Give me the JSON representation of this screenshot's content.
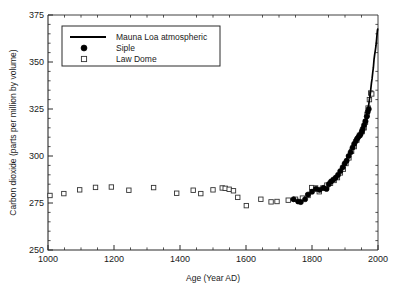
{
  "figure": {
    "width": 408,
    "height": 294,
    "background": "#ffffff"
  },
  "chart_data": {
    "type": "scatter",
    "title": "",
    "xlabel": "Age (Year AD)",
    "ylabel": "Carbon dioxide (parts per million by volume)",
    "xlim": [
      1000,
      2000
    ],
    "ylim": [
      250,
      375
    ],
    "xticks": [
      1000,
      1200,
      1400,
      1600,
      1800,
      2000
    ],
    "xticklabels": [
      "1000",
      "1200",
      "1400",
      "1600",
      "1800",
      "2000"
    ],
    "yticks": [
      250,
      275,
      300,
      325,
      350,
      375
    ],
    "yticklabels": [
      "250",
      "275",
      "300",
      "325",
      "350",
      "375"
    ],
    "x_minor_tick_interval": 50,
    "y_minor_tick_interval": 5,
    "grid": false,
    "legend_position": "upper-left-inside",
    "legend": [
      {
        "label": "Mauna Loa atmospheric",
        "marker": "line",
        "color": "#000000"
      },
      {
        "label": "Siple",
        "marker": "filled-circle",
        "color": "#000000"
      },
      {
        "label": "Law Dome",
        "marker": "open-square",
        "color": "#333333"
      }
    ],
    "series": [
      {
        "name": "Law Dome",
        "marker": "open-square",
        "points": [
          [
            1006,
            279.0
          ],
          [
            1048,
            280.0
          ],
          [
            1096,
            282.0
          ],
          [
            1144,
            283.3
          ],
          [
            1192,
            283.5
          ],
          [
            1245,
            281.8
          ],
          [
            1320,
            283.2
          ],
          [
            1390,
            280.2
          ],
          [
            1440,
            281.8
          ],
          [
            1463,
            280.0
          ],
          [
            1500,
            282.0
          ],
          [
            1528,
            283.0
          ],
          [
            1537,
            282.8
          ],
          [
            1549,
            282.3
          ],
          [
            1562,
            281.5
          ],
          [
            1575,
            278.0
          ],
          [
            1601,
            273.6
          ],
          [
            1645,
            277.0
          ],
          [
            1676,
            275.6
          ],
          [
            1694,
            275.8
          ],
          [
            1728,
            276.5
          ],
          [
            1750,
            277.0
          ],
          [
            1771,
            277.6
          ],
          [
            1788,
            279.0
          ],
          [
            1799,
            283.2
          ],
          [
            1811,
            283.0
          ],
          [
            1822,
            281.0
          ],
          [
            1833,
            283.0
          ],
          [
            1845,
            284.5
          ],
          [
            1856,
            285.5
          ],
          [
            1867,
            287.0
          ],
          [
            1877,
            288.5
          ],
          [
            1886,
            291.0
          ],
          [
            1895,
            293.0
          ],
          [
            1903,
            296.0
          ],
          [
            1912,
            299.0
          ],
          [
            1920,
            302.5
          ],
          [
            1928,
            305.0
          ],
          [
            1936,
            308.5
          ],
          [
            1944,
            311.0
          ],
          [
            1952,
            313.0
          ],
          [
            1958,
            315.0
          ],
          [
            1962,
            318.0
          ],
          [
            1967,
            322.0
          ],
          [
            1970,
            325.5
          ],
          [
            1974,
            330.0
          ],
          [
            1978,
            333.5
          ],
          [
            1981,
            333.0
          ]
        ]
      },
      {
        "name": "Siple",
        "marker": "filled-circle",
        "points": [
          [
            1744,
            277.0
          ],
          [
            1758,
            275.8
          ],
          [
            1766,
            275.5
          ],
          [
            1779,
            277.0
          ],
          [
            1788,
            279.5
          ],
          [
            1800,
            281.0
          ],
          [
            1812,
            282.5
          ],
          [
            1823,
            282.0
          ],
          [
            1835,
            283.0
          ],
          [
            1844,
            282.5
          ],
          [
            1851,
            285.0
          ],
          [
            1858,
            286.5
          ],
          [
            1865,
            287.5
          ],
          [
            1872,
            288.5
          ],
          [
            1879,
            290.0
          ],
          [
            1886,
            292.0
          ],
          [
            1893,
            294.0
          ],
          [
            1899,
            296.0
          ],
          [
            1905,
            297.5
          ],
          [
            1911,
            300.0
          ],
          [
            1917,
            302.0
          ],
          [
            1923,
            304.5
          ],
          [
            1928,
            306.5
          ],
          [
            1933,
            308.0
          ],
          [
            1938,
            309.5
          ],
          [
            1942,
            310.5
          ],
          [
            1947,
            311.5
          ],
          [
            1951,
            313.0
          ],
          [
            1954,
            314.5
          ],
          [
            1958,
            316.5
          ],
          [
            1962,
            318.5
          ],
          [
            1966,
            321.0
          ],
          [
            1969,
            323.5
          ],
          [
            1972,
            325.0
          ]
        ]
      },
      {
        "name": "Mauna Loa atmospheric",
        "marker": "line",
        "points": [
          [
            1958,
            315.0
          ],
          [
            1960,
            316.8
          ],
          [
            1962,
            318.3
          ],
          [
            1964,
            319.5
          ],
          [
            1966,
            321.3
          ],
          [
            1968,
            323.0
          ],
          [
            1970,
            325.6
          ],
          [
            1972,
            327.4
          ],
          [
            1974,
            330.1
          ],
          [
            1976,
            332.0
          ],
          [
            1978,
            335.3
          ],
          [
            1980,
            338.6
          ],
          [
            1982,
            341.0
          ],
          [
            1984,
            344.3
          ],
          [
            1986,
            347.1
          ],
          [
            1988,
            351.4
          ],
          [
            1990,
            354.1
          ],
          [
            1992,
            356.3
          ],
          [
            1994,
            358.8
          ],
          [
            1996,
            362.5
          ],
          [
            1998,
            366.5
          ],
          [
            1999,
            367.5
          ]
        ]
      }
    ]
  }
}
